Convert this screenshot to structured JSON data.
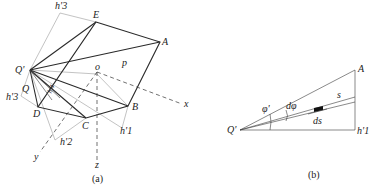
{
  "figure": {
    "panels": [
      {
        "id": "a",
        "caption": "(a)",
        "labels": {
          "h3_top": "h'3",
          "E": "E",
          "A": "A",
          "Q_prime": "Q'",
          "p": "p",
          "o": "o",
          "Q": "Q",
          "h3_left": "h'3",
          "h4": "h'4",
          "D": "D",
          "B": "B",
          "C": "C",
          "h1": "h'1",
          "h2": "h'2",
          "x": "x",
          "y": "y",
          "z": "z"
        }
      },
      {
        "id": "b",
        "caption": "(b)",
        "labels": {
          "Q_prime": "Q'",
          "A": "A",
          "h1": "h'1",
          "phi": "φ'",
          "dphi": "dφ",
          "s": "s",
          "ds": "ds"
        }
      }
    ]
  }
}
